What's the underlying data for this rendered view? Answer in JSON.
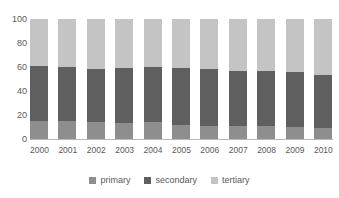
{
  "chart_data": {
    "type": "bar",
    "subtype": "stacked-100-percent",
    "title": "",
    "xlabel": "",
    "ylabel": "",
    "ylim": [
      0,
      100
    ],
    "yticks": [
      0,
      20,
      40,
      60,
      80,
      100
    ],
    "grid": false,
    "legend_position": "bottom",
    "categories": [
      "2000",
      "2001",
      "2002",
      "2003",
      "2004",
      "2005",
      "2006",
      "2007",
      "2008",
      "2009",
      "2010"
    ],
    "series": [
      {
        "name": "primary",
        "color": "#8e8e8e",
        "values": [
          15,
          15,
          14,
          13,
          14,
          12,
          11,
          11,
          11,
          10,
          9
        ]
      },
      {
        "name": "secondary",
        "color": "#5f5f5f",
        "values": [
          46,
          45,
          44,
          46,
          46,
          47,
          47,
          46,
          46,
          46,
          44
        ]
      },
      {
        "name": "tertiary",
        "color": "#c4c4c4",
        "values": [
          39,
          40,
          42,
          41,
          40,
          41,
          42,
          43,
          43,
          44,
          47
        ]
      }
    ]
  },
  "axis": {
    "y_tick_labels": [
      "100",
      "80",
      "60",
      "40",
      "20",
      "0"
    ]
  },
  "legend": {
    "entries": [
      {
        "label": "primary",
        "color": "#8e8e8e"
      },
      {
        "label": "secondary",
        "color": "#5f5f5f"
      },
      {
        "label": "tertiary",
        "color": "#c4c4c4"
      }
    ]
  }
}
